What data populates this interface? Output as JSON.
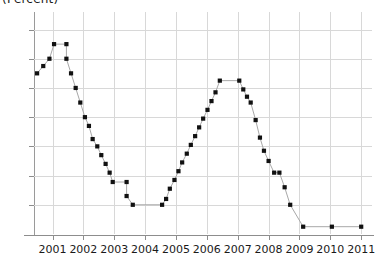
{
  "chart": {
    "title": "(Percent)",
    "y_axis_suffix": "%"
  },
  "axes": {
    "y_ticks": [
      {
        "value": 7,
        "label": "7%"
      },
      {
        "value": 6,
        "label": "6"
      },
      {
        "value": 5,
        "label": "5"
      },
      {
        "value": 4,
        "label": "4"
      },
      {
        "value": 3,
        "label": "3"
      },
      {
        "value": 2,
        "label": "2"
      },
      {
        "value": 1,
        "label": "1"
      }
    ],
    "x_ticks": [
      {
        "value": 2001,
        "label": "2001"
      },
      {
        "value": 2002,
        "label": "2002"
      },
      {
        "value": 2003,
        "label": "2003"
      },
      {
        "value": 2004,
        "label": "2004"
      },
      {
        "value": 2005,
        "label": "2005"
      },
      {
        "value": 2006,
        "label": "2006"
      },
      {
        "value": 2007,
        "label": "2007"
      },
      {
        "value": 2008,
        "label": "2008"
      },
      {
        "value": 2009,
        "label": "2009"
      },
      {
        "value": 2010,
        "label": "2010"
      },
      {
        "value": 2011,
        "label": "2011"
      }
    ]
  },
  "chart_data": {
    "type": "line",
    "title": "(Percent)",
    "xlabel": "",
    "ylabel": "Percent",
    "xlim": [
      2000.4,
      2011.35
    ],
    "ylim": [
      0,
      7.6
    ],
    "grid": true,
    "legend": null,
    "marker": "square",
    "marker_color": "#111111",
    "line_color": "#a8a8a8",
    "x": [
      2000.5,
      2000.75,
      2001.0,
      2001.25,
      2001.5,
      2001.75,
      2002.0,
      2002.25,
      2002.5,
      2002.75,
      2003.0,
      2003.25,
      2003.5,
      2003.75,
      2004.0,
      2004.25,
      2004.5,
      2004.75,
      2005.0,
      2005.25,
      2005.5,
      2005.75,
      2006.0,
      2006.25,
      2006.5,
      2006.75,
      2007.0,
      2007.25,
      2007.5,
      2007.75,
      2008.0,
      2008.25,
      2008.5,
      2008.75,
      2009.0,
      2009.25,
      2009.5,
      2009.75,
      2010.0,
      2010.5,
      2011.0,
      2011.25
    ],
    "values": [
      5.5,
      5.75,
      6.0,
      6.5,
      6.5,
      6.0,
      5.5,
      5.0,
      4.5,
      4.0,
      3.75,
      3.25,
      3.0,
      2.75,
      2.5,
      2.25,
      1.75,
      1.75,
      1.25,
      1.25,
      1.0,
      1.0,
      1.0,
      1.25,
      1.75,
      2.25,
      2.75,
      3.25,
      3.75,
      4.25,
      4.75,
      5.25,
      5.25,
      5.25,
      4.75,
      4.5,
      4.25,
      3.5,
      2.75,
      2.0,
      1.0,
      0.25
    ],
    "series": [
      {
        "name": "rate",
        "points": [
          {
            "x": 2000.5,
            "y": 5.5
          },
          {
            "x": 2000.7,
            "y": 5.75
          },
          {
            "x": 2000.9,
            "y": 6.0
          },
          {
            "x": 2001.05,
            "y": 6.5
          },
          {
            "x": 2001.45,
            "y": 6.5
          },
          {
            "x": 2001.45,
            "y": 6.0
          },
          {
            "x": 2001.6,
            "y": 5.5
          },
          {
            "x": 2001.75,
            "y": 5.0
          },
          {
            "x": 2001.9,
            "y": 4.5
          },
          {
            "x": 2002.05,
            "y": 4.0
          },
          {
            "x": 2002.18,
            "y": 3.7
          },
          {
            "x": 2002.3,
            "y": 3.25
          },
          {
            "x": 2002.45,
            "y": 3.0
          },
          {
            "x": 2002.58,
            "y": 2.7
          },
          {
            "x": 2002.72,
            "y": 2.4
          },
          {
            "x": 2002.85,
            "y": 2.1
          },
          {
            "x": 2002.95,
            "y": 1.78
          },
          {
            "x": 2003.4,
            "y": 1.78
          },
          {
            "x": 2003.4,
            "y": 1.3
          },
          {
            "x": 2003.6,
            "y": 1.0
          },
          {
            "x": 2004.55,
            "y": 1.0
          },
          {
            "x": 2004.68,
            "y": 1.2
          },
          {
            "x": 2004.8,
            "y": 1.55
          },
          {
            "x": 2004.95,
            "y": 1.85
          },
          {
            "x": 2005.08,
            "y": 2.15
          },
          {
            "x": 2005.2,
            "y": 2.45
          },
          {
            "x": 2005.35,
            "y": 2.75
          },
          {
            "x": 2005.48,
            "y": 3.05
          },
          {
            "x": 2005.62,
            "y": 3.35
          },
          {
            "x": 2005.75,
            "y": 3.65
          },
          {
            "x": 2005.88,
            "y": 3.95
          },
          {
            "x": 2006.02,
            "y": 4.25
          },
          {
            "x": 2006.15,
            "y": 4.55
          },
          {
            "x": 2006.28,
            "y": 4.85
          },
          {
            "x": 2006.42,
            "y": 5.25
          },
          {
            "x": 2007.05,
            "y": 5.25
          },
          {
            "x": 2007.18,
            "y": 4.95
          },
          {
            "x": 2007.3,
            "y": 4.7
          },
          {
            "x": 2007.42,
            "y": 4.5
          },
          {
            "x": 2007.58,
            "y": 3.9
          },
          {
            "x": 2007.72,
            "y": 3.3
          },
          {
            "x": 2007.85,
            "y": 2.85
          },
          {
            "x": 2008.0,
            "y": 2.5
          },
          {
            "x": 2008.18,
            "y": 2.1
          },
          {
            "x": 2008.35,
            "y": 2.1
          },
          {
            "x": 2008.52,
            "y": 1.6
          },
          {
            "x": 2008.7,
            "y": 1.0
          },
          {
            "x": 2009.12,
            "y": 0.25
          },
          {
            "x": 2010.05,
            "y": 0.25
          },
          {
            "x": 2011.0,
            "y": 0.25
          }
        ]
      }
    ]
  }
}
